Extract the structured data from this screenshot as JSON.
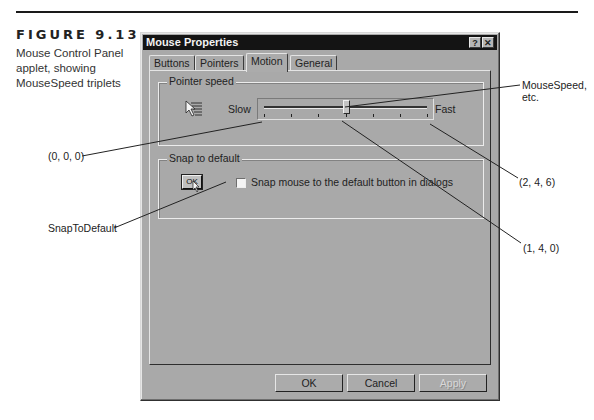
{
  "figure": {
    "number": "FIGURE 9.13",
    "caption": "Mouse Control Panel applet, showing MouseSpeed triplets"
  },
  "dialog": {
    "title": "Mouse Properties",
    "title_buttons": {
      "help": "?",
      "close": "✕"
    },
    "tabs": [
      {
        "label": "Buttons",
        "active": false
      },
      {
        "label": "Pointers",
        "active": false
      },
      {
        "label": "Motion",
        "active": true
      },
      {
        "label": "General",
        "active": false
      }
    ],
    "pointer_speed": {
      "group_label": "Pointer speed",
      "icon": "pointer-trail-icon",
      "slow_label": "Slow",
      "fast_label": "Fast",
      "tick_count": 7,
      "value_index": 3
    },
    "snap_to_default": {
      "group_label": "Snap to default",
      "icon_button_label": "OK",
      "checkbox_label": "Snap mouse to the default button in dialogs",
      "checked": false
    },
    "buttons": {
      "ok": "OK",
      "cancel": "Cancel",
      "apply": "Apply",
      "apply_disabled": true
    }
  },
  "callouts": {
    "mousespeed": "MouseSpeed, etc.",
    "slow_triplet": "(0, 0, 0)",
    "fast_triplet": "(2, 4, 6)",
    "middle_triplet": "(1, 4, 0)",
    "snaptodefault": "SnapToDefault"
  }
}
